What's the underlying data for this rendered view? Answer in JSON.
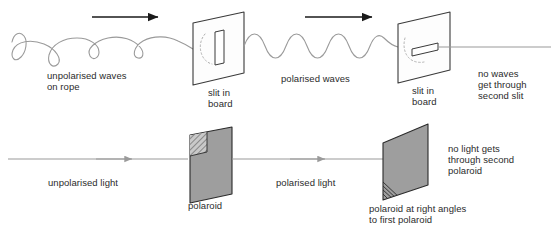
{
  "figure": {
    "type": "physics-diagram",
    "background_color": "#ffffff",
    "text_color": "#2b2b2b",
    "wave_color": "#9a9a9a",
    "ray_color": "#9a9a9a",
    "arrow_color": "#1a1a1a",
    "board_fill": "#fdfdfd",
    "board_stroke": "#3a3a3a",
    "polaroid_fill": "#9e9e9e",
    "polaroid_stroke": "#2b2b2b"
  },
  "rows": {
    "mechanical": {
      "name": "mechanical-wave-row",
      "labels": {
        "source": "unpolarised waves\non rope",
        "source_line1": "unpolarised waves",
        "source_line2": "on rope",
        "first_barrier": "slit in\nboard",
        "first_barrier_line1": "slit in",
        "first_barrier_line2": "board",
        "middle": "polarised waves",
        "second_barrier": "slit in\nboard",
        "second_barrier_line1": "slit in",
        "second_barrier_line2": "board",
        "result": "no waves\nget through\nsecond slit",
        "result_line1": "no waves",
        "result_line2": "get through",
        "result_line3": "second slit"
      },
      "elements": {
        "first_slit_orientation": "vertical",
        "second_slit_orientation": "horizontal",
        "direction_arrows": 2,
        "direction": "left-to-right"
      }
    },
    "optical": {
      "name": "light-polaroid-row",
      "labels": {
        "source": "unpolarised light",
        "first_filter": "polaroid",
        "middle": "polarised light",
        "second_filter": "polaroid at right angles\nto first polaroid",
        "second_filter_line1": "polaroid at right angles",
        "second_filter_line2": "to first polaroid",
        "result": "no light gets\nthrough second\npolaroid",
        "result_line1": "no light gets",
        "result_line2": "through second",
        "result_line3": "polaroid"
      },
      "elements": {
        "first_filter_hatch_position": "top-left",
        "second_filter_hatch_position": "bottom-left",
        "direction_arrows": 2,
        "direction": "left-to-right"
      }
    }
  }
}
